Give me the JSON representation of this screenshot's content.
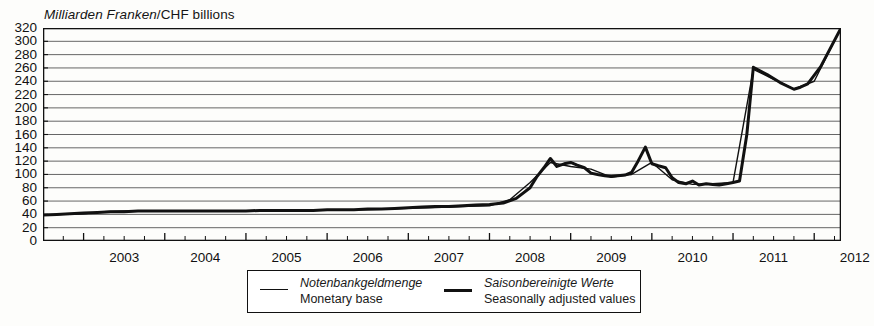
{
  "chart_data": {
    "type": "line",
    "title": "Milliarden Franken/CHF billions",
    "title_de": "Milliarden Franken",
    "title_en": "CHF billions",
    "xlabel": "",
    "ylabel": "Milliarden Franken / CHF billions",
    "ylim": [
      0,
      320
    ],
    "ytick_step": 20,
    "yticks": [
      0,
      20,
      40,
      60,
      80,
      100,
      120,
      140,
      160,
      180,
      200,
      220,
      240,
      260,
      280,
      300,
      320
    ],
    "xlim": [
      2002.5,
      2012.33
    ],
    "xticks": [
      2003,
      2004,
      2005,
      2006,
      2007,
      2008,
      2009,
      2010,
      2011,
      2012
    ],
    "xtick_labels": [
      "2003",
      "2004",
      "2005",
      "2006",
      "2007",
      "2008",
      "2009",
      "2010",
      "2011",
      "2012"
    ],
    "minor_tick_interval": 0.25,
    "grid": true,
    "grid_axis": "y",
    "legend_position": "below",
    "series": [
      {
        "name": "Notenbankgeldmenge / Monetary base",
        "name_de": "Notenbankgeldmenge",
        "name_en": "Monetary base",
        "style": "thin",
        "linewidth": 1.4,
        "color": "#111111",
        "x": [
          2002.5,
          2002.75,
          2003.0,
          2003.25,
          2003.5,
          2003.75,
          2004.0,
          2004.25,
          2004.5,
          2004.75,
          2005.0,
          2005.25,
          2005.5,
          2005.75,
          2006.0,
          2006.25,
          2006.5,
          2006.75,
          2007.0,
          2007.25,
          2007.5,
          2007.75,
          2008.0,
          2008.25,
          2008.5,
          2008.75,
          2009.0,
          2009.25,
          2009.5,
          2009.75,
          2010.0,
          2010.25,
          2010.5,
          2010.75,
          2011.0,
          2011.25,
          2011.5,
          2011.75,
          2012.0,
          2012.33
        ],
        "y": [
          39,
          40,
          41,
          44,
          45,
          45,
          45,
          45,
          45,
          45,
          45,
          46,
          46,
          46,
          46,
          47,
          47,
          48,
          49,
          50,
          51,
          52,
          53,
          62,
          88,
          118,
          112,
          108,
          96,
          100,
          118,
          92,
          85,
          86,
          88,
          258,
          243,
          228,
          240,
          320
        ]
      },
      {
        "name": "Saisonbereinigte Werte / Seasonally adjusted values",
        "name_de": "Saisonbereinigte Werte",
        "name_en": "Seasonally adjusted values",
        "style": "thick",
        "linewidth": 3.0,
        "color": "#111111",
        "x": [
          2002.5,
          2002.67,
          2002.83,
          2003.0,
          2003.17,
          2003.33,
          2003.5,
          2003.67,
          2003.83,
          2004.0,
          2004.17,
          2004.33,
          2004.5,
          2004.67,
          2004.83,
          2005.0,
          2005.17,
          2005.33,
          2005.5,
          2005.67,
          2005.83,
          2006.0,
          2006.17,
          2006.33,
          2006.5,
          2006.67,
          2006.83,
          2007.0,
          2007.17,
          2007.33,
          2007.5,
          2007.67,
          2007.83,
          2008.0,
          2008.17,
          2008.33,
          2008.5,
          2008.58,
          2008.67,
          2008.75,
          2008.83,
          2008.92,
          2009.0,
          2009.08,
          2009.17,
          2009.25,
          2009.33,
          2009.42,
          2009.5,
          2009.58,
          2009.67,
          2009.75,
          2009.83,
          2009.92,
          2010.0,
          2010.08,
          2010.17,
          2010.25,
          2010.33,
          2010.42,
          2010.5,
          2010.58,
          2010.67,
          2010.75,
          2010.83,
          2010.92,
          2011.0,
          2011.08,
          2011.17,
          2011.25,
          2011.42,
          2011.58,
          2011.75,
          2011.83,
          2011.92,
          2012.08,
          2012.33
        ],
        "y": [
          39,
          40,
          41,
          42,
          43,
          44,
          44,
          45,
          45,
          45,
          45,
          45,
          45,
          45,
          45,
          45,
          46,
          46,
          46,
          46,
          46,
          47,
          47,
          47,
          48,
          48,
          49,
          50,
          51,
          52,
          52,
          53,
          54,
          55,
          57,
          64,
          80,
          96,
          110,
          124,
          112,
          116,
          118,
          114,
          110,
          102,
          100,
          98,
          97,
          98,
          99,
          103,
          120,
          141,
          116,
          113,
          110,
          95,
          88,
          86,
          90,
          84,
          86,
          85,
          84,
          86,
          88,
          90,
          160,
          261,
          250,
          238,
          228,
          231,
          236,
          262,
          320
        ]
      }
    ],
    "annotations": []
  },
  "legend": {
    "entries": [
      {
        "swatch": "thin-line",
        "label_de": "Notenbankgeldmenge",
        "label_en": "Monetary base"
      },
      {
        "swatch": "thick-line",
        "label_de": "Saisonbereinigte Werte",
        "label_en": "Seasonally adjusted values"
      }
    ]
  },
  "colors": {
    "line": "#111111",
    "grid": "#555555",
    "axis": "#111111",
    "background": "#fdfdfb"
  }
}
